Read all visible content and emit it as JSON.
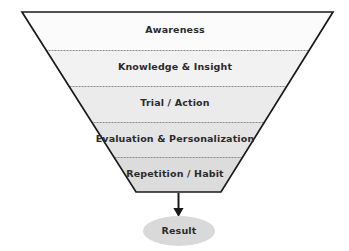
{
  "diagram": {
    "type": "funnel",
    "shape": "inverted-trapezoid",
    "background_color": "#ffffff",
    "outline_color": "#1a1a1a",
    "divider_color": "#8c8c8c",
    "text_color": "#2b2b2b",
    "stages": [
      {
        "label": "Awareness",
        "order": 1,
        "fill": "#fbfbfb",
        "label_x": 175,
        "label_y": 30
      },
      {
        "label": "Knowledge & Insight",
        "order": 2,
        "fill": "#f2f2f2",
        "label_x": 175,
        "label_y": 67
      },
      {
        "label": "Trial / Action",
        "order": 3,
        "fill": "#ebebeb",
        "label_x": 175,
        "label_y": 103
      },
      {
        "label": "Evaluation & Personalization",
        "order": 4,
        "fill": "#e4e4e4",
        "label_x": 175,
        "label_y": 139
      },
      {
        "label": "Repetition / Habit",
        "order": 5,
        "fill": "#dcdcdc",
        "label_x": 175,
        "label_y": 174
      }
    ],
    "dividers_y": [
      50,
      86,
      122,
      157
    ],
    "geometry": {
      "top_left_x": 22,
      "top_right_x": 333,
      "top_y": 12,
      "bottom_left_x": 136,
      "bottom_right_x": 221,
      "bottom_y": 192
    },
    "arrow": {
      "name": "down-arrow",
      "x": 178,
      "from_y": 193,
      "to_y": 216,
      "color": "#1a1a1a"
    },
    "outcome": {
      "label": "Result",
      "shape": "ellipse",
      "fill": "#d9d9d9",
      "center_x": 179,
      "center_y": 231,
      "radius_x": 36,
      "radius_y": 15
    }
  }
}
